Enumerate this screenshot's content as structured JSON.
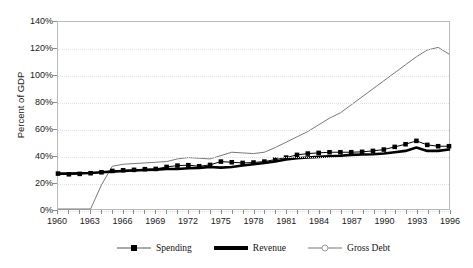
{
  "chart_data": {
    "type": "line",
    "title": "",
    "xlabel": "",
    "ylabel": "Percent of GDP",
    "ylim": [
      0,
      140
    ],
    "ytick_labels": [
      "0%",
      "20%",
      "40%",
      "60%",
      "80%",
      "100%",
      "120%",
      "140%"
    ],
    "ytick_values": [
      0,
      20,
      40,
      60,
      80,
      100,
      120,
      140
    ],
    "xlim": [
      1960,
      1996
    ],
    "grid": true,
    "legend_position": "bottom",
    "x": [
      1960,
      1961,
      1962,
      1963,
      1964,
      1965,
      1966,
      1967,
      1968,
      1969,
      1970,
      1971,
      1972,
      1973,
      1974,
      1975,
      1976,
      1977,
      1978,
      1979,
      1980,
      1981,
      1982,
      1983,
      1984,
      1985,
      1986,
      1987,
      1988,
      1989,
      1990,
      1991,
      1992,
      1993,
      1994,
      1995,
      1996
    ],
    "xtick_labels": [
      "1960",
      "1963",
      "1966",
      "1969",
      "1972",
      "1975",
      "1978",
      "1981",
      "1984",
      "1987",
      "1990",
      "1993",
      "1996"
    ],
    "xtick_values": [
      1960,
      1963,
      1966,
      1969,
      1972,
      1975,
      1978,
      1981,
      1984,
      1987,
      1990,
      1993,
      1996
    ],
    "series": [
      {
        "name": "Spending",
        "style": "thin-line-square-markers",
        "color": "#000000",
        "values": [
          26.5,
          26.0,
          26.3,
          26.8,
          27.5,
          28.5,
          29.0,
          29.3,
          29.8,
          30.0,
          31.5,
          32.5,
          32.8,
          32.0,
          33.0,
          35.5,
          35.0,
          34.5,
          34.8,
          35.5,
          37.0,
          38.5,
          40.5,
          41.5,
          42.0,
          42.5,
          42.5,
          42.5,
          42.8,
          43.5,
          44.5,
          46.5,
          48.5,
          51.0,
          48.0,
          47.0,
          47.0
        ]
      },
      {
        "name": "Revenue",
        "style": "thick-line",
        "color": "#000000",
        "values": [
          26.5,
          26.5,
          26.8,
          27.0,
          27.5,
          28.0,
          28.5,
          28.8,
          29.2,
          29.5,
          30.0,
          30.0,
          30.5,
          30.8,
          31.5,
          31.0,
          31.5,
          32.5,
          33.5,
          34.5,
          35.5,
          37.0,
          38.0,
          38.5,
          39.0,
          39.5,
          39.8,
          40.5,
          40.8,
          41.0,
          41.5,
          42.5,
          43.5,
          46.0,
          43.5,
          43.5,
          44.5
        ]
      },
      {
        "name": "Gross Debt",
        "style": "thin-line",
        "color": "#777777",
        "values": [
          0,
          0,
          0,
          0,
          18.0,
          32.0,
          33.5,
          34.0,
          34.5,
          35.0,
          35.5,
          37.5,
          38.5,
          38.0,
          37.5,
          40.0,
          42.5,
          42.0,
          41.5,
          42.5,
          46.0,
          50.0,
          54.0,
          58.0,
          63.0,
          68.0,
          72.0,
          78.0,
          84.0,
          90.0,
          96.0,
          102.0,
          108.0,
          114.0,
          119.0,
          121.0,
          116.0
        ]
      }
    ]
  }
}
